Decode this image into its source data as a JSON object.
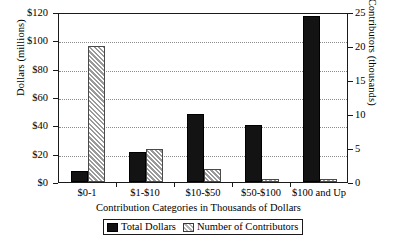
{
  "chart_data": {
    "type": "bar",
    "title": "",
    "categories": [
      "$0-1",
      "$1-$10",
      "$10-$50",
      "$50-$100",
      "$100 and Up"
    ],
    "series": [
      {
        "name": "Total Dollars",
        "axis": "left",
        "unit": "millions of dollars",
        "values": [
          8,
          21,
          48,
          40,
          117
        ]
      },
      {
        "name": "Number of Contributors",
        "axis": "right",
        "unit": "thousands of contributors",
        "values": [
          20.0,
          4.9,
          1.9,
          0.5,
          0.4
        ]
      }
    ],
    "xlabel": "Contribution Categories in Thousands of Dollars",
    "ylabel": "Dollars (millions)",
    "y2label": "Number of Contributors (thousands)",
    "ylim": [
      0,
      120
    ],
    "y2lim": [
      0,
      25
    ],
    "yticks": [
      "$0",
      "$20",
      "$40",
      "$60",
      "$80",
      "$100",
      "$120"
    ],
    "ytick_values": [
      0,
      20,
      40,
      60,
      80,
      100,
      120
    ],
    "y2ticks": [
      "0",
      "5",
      "10",
      "15",
      "20",
      "25"
    ],
    "y2tick_values": [
      0,
      5,
      10,
      15,
      20,
      25
    ],
    "grid": "horizontal-dotted",
    "legend_position": "bottom-center",
    "colors": {
      "total_dollars": "#131313",
      "number_of_contributors": "#d6d6d6",
      "axis": "#1a1a1a",
      "gridline": "#8c8c8c",
      "background": "#ffffff"
    }
  },
  "legend": {
    "items": [
      {
        "label": "Total Dollars",
        "swatch": "solid-dark"
      },
      {
        "label": "Number of Contributors",
        "swatch": "hatched-light"
      }
    ]
  },
  "caption": {
    "text": ""
  }
}
